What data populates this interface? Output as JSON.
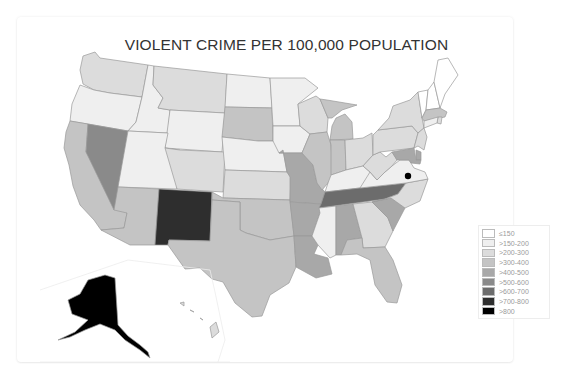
{
  "top_strip_fragments": [
    "·",
    "·",
    "·"
  ],
  "chart_data": {
    "type": "choropleth",
    "title": "VIOLENT CRIME PER 100,000 POPULATION",
    "legend_position": "bottom-right",
    "legend": [
      {
        "label": "≤150",
        "color": "#ffffff"
      },
      {
        "label": ">150-200",
        "color": "#efefef"
      },
      {
        "label": ">200-300",
        "color": "#dcdcdc"
      },
      {
        "label": ">300-400",
        "color": "#c4c4c4"
      },
      {
        "label": ">400-500",
        "color": "#a8a8a8"
      },
      {
        "label": ">500-600",
        "color": "#8a8a8a"
      },
      {
        "label": ">600-700",
        "color": "#6c6c6c"
      },
      {
        "label": ">700-800",
        "color": "#2e2e2e"
      },
      {
        "label": ">800",
        "color": "#000000"
      }
    ],
    "states": {
      "WA": ">200-300",
      "OR": ">150-200",
      "CA": ">300-400",
      "NV": ">500-600",
      "ID": ">150-200",
      "MT": ">200-300",
      "WY": ">150-200",
      "UT": ">150-200",
      "AZ": ">300-400",
      "CO": ">200-300",
      "NM": ">700-800",
      "ND": ">150-200",
      "SD": ">300-400",
      "NE": ">150-200",
      "KS": ">200-300",
      "OK": ">300-400",
      "TX": ">300-400",
      "MN": ">150-200",
      "IA": ">150-200",
      "MO": ">400-500",
      "AR": ">400-500",
      "LA": ">400-500",
      "WI": ">200-300",
      "IL": ">300-400",
      "MI": ">300-400",
      "IN": ">300-400",
      "OH": ">200-300",
      "KY": ">150-200",
      "TN": ">600-700",
      "MS": ">150-200",
      "AL": ">400-500",
      "GA": ">200-300",
      "FL": ">300-400",
      "SC": ">400-500",
      "NC": ">200-300",
      "VA": ">150-200",
      "WV": ">200-300",
      "PA": ">200-300",
      "NY": ">200-300",
      "VT": "≤150",
      "NH": "≤150",
      "ME": "≤150",
      "MA": ">300-400",
      "RI": ">200-300",
      "CT": ">150-200",
      "NJ": ">200-300",
      "DE": ">400-500",
      "MD": ">400-500",
      "DC": ">800",
      "AK": ">800",
      "HI": ">200-300"
    }
  }
}
